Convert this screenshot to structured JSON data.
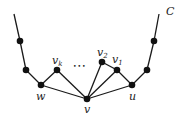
{
  "diagram": {
    "curve_label": "C",
    "nodes": {
      "c_top_left": {
        "x": 14,
        "y": 14,
        "dot": false
      },
      "left_1": {
        "x": 20,
        "y": 41,
        "dot": true
      },
      "left_2": {
        "x": 26,
        "y": 70,
        "dot": true
      },
      "w": {
        "x": 41,
        "y": 85,
        "dot": true,
        "label": "w"
      },
      "vk": {
        "x": 57,
        "y": 70,
        "dot": true,
        "label": "v",
        "sub": "k"
      },
      "v": {
        "x": 87,
        "y": 99,
        "dot": true,
        "label": "v"
      },
      "v2": {
        "x": 102,
        "y": 62,
        "dot": true,
        "label": "v",
        "sub": "2"
      },
      "v1": {
        "x": 117,
        "y": 70,
        "dot": true,
        "label": "v",
        "sub": "1"
      },
      "u": {
        "x": 132,
        "y": 85,
        "dot": true,
        "label": "u"
      },
      "right_2": {
        "x": 147,
        "y": 70,
        "dot": true
      },
      "right_1": {
        "x": 154,
        "y": 41,
        "dot": true
      },
      "c_top_right": {
        "x": 159,
        "y": 14,
        "dot": false
      }
    },
    "edges": [
      [
        "c_top_left",
        "left_1"
      ],
      [
        "left_1",
        "left_2"
      ],
      [
        "left_2",
        "w"
      ],
      [
        "w",
        "vk"
      ],
      [
        "vk",
        "v"
      ],
      [
        "w",
        "v"
      ],
      [
        "v",
        "v2"
      ],
      [
        "v",
        "v1"
      ],
      [
        "v",
        "u"
      ],
      [
        "v2",
        "v1"
      ],
      [
        "v1",
        "u"
      ],
      [
        "u",
        "right_2"
      ],
      [
        "right_2",
        "right_1"
      ],
      [
        "right_1",
        "c_top_right"
      ]
    ],
    "ellipsis": "•••",
    "labels": {
      "w": "w",
      "v": "v",
      "u": "u",
      "vk_main": "v",
      "vk_sub": "k",
      "v2_main": "v",
      "v2_sub": "2",
      "v1_main": "v",
      "v1_sub": "1",
      "C": "C"
    }
  }
}
